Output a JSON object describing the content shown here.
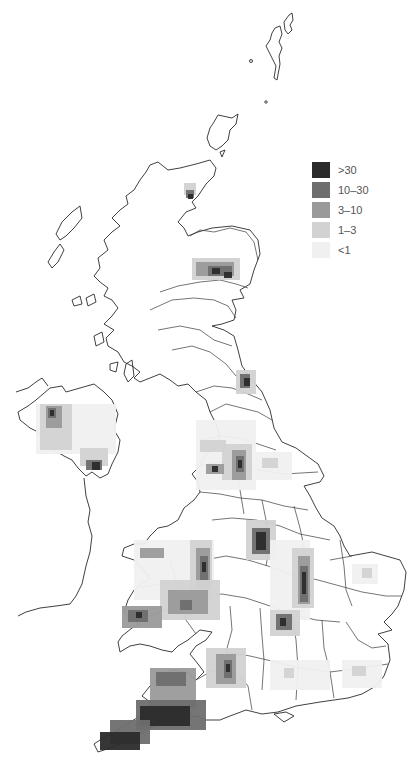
{
  "map": {
    "title": "",
    "region": "United Kingdom",
    "legend": {
      "items": [
        {
          "label": ">30",
          "color": "#2b2b2b"
        },
        {
          "label": "10–30",
          "color": "#6e6e6e"
        },
        {
          "label": "3–10",
          "color": "#9a9a9a"
        },
        {
          "label": "1–3",
          "color": "#d2d2d2"
        },
        {
          "label": "<1",
          "color": "#f0f0f0"
        }
      ]
    },
    "hotspots": [
      {
        "area": "Caithness / north-east Highland coast",
        "level": ">30"
      },
      {
        "area": "Aberdeenshire",
        "level": ">30"
      },
      {
        "area": "North-east England (Durham)",
        "level": ">30"
      },
      {
        "area": "Northern Ireland (south-east & west)",
        "level": ">30"
      },
      {
        "area": "Pennines / Lancashire & Yorkshire",
        "level": "10–30"
      },
      {
        "area": "Derbyshire / Peak District",
        "level": ">30"
      },
      {
        "area": "Wales (north, mid & south-west)",
        "level": "10–30"
      },
      {
        "area": "Northamptonshire / Lincolnshire belt",
        "level": ">30"
      },
      {
        "area": "Somerset / Mendips",
        "level": "10–30"
      },
      {
        "area": "Devon & Cornwall",
        "level": ">30"
      }
    ]
  }
}
